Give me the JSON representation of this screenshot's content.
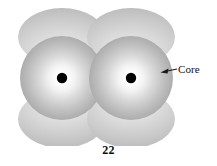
{
  "figure": {
    "caption_number": "22",
    "alt_title": "Overlapping atomic orbitals with cores",
    "background_color": "#ffffff"
  },
  "annotations": {
    "core_label": "Core",
    "core_label_color": "#111111",
    "arrow_color": "#1a1a1a"
  },
  "diagram": {
    "type": "orbital-overlap",
    "lobe_color_light": "#e4e4e4",
    "lobe_color_mid": "#cdcdcd",
    "lobe_color_dark": "#b9b9b9",
    "core_highlight_color": "#ffffff",
    "core_mid_color": "#d2d2d2",
    "core_edge_color": "#a8a8a8",
    "nucleus_color": "#000000",
    "nuclei": [
      {
        "name": "left-nucleus",
        "cx": 62,
        "cy": 78,
        "r": 5
      },
      {
        "name": "right-nucleus",
        "cx": 131,
        "cy": 78,
        "r": 5
      }
    ],
    "cores": [
      {
        "name": "left-core",
        "cx": 62,
        "cy": 78,
        "rx": 42,
        "ry": 42
      },
      {
        "name": "right-core",
        "cx": 131,
        "cy": 78,
        "rx": 42,
        "ry": 42
      }
    ],
    "lobes": [
      {
        "name": "top-left-lobe",
        "cx": 62,
        "cy": 37,
        "rx": 44,
        "ry": 29
      },
      {
        "name": "top-right-lobe",
        "cx": 131,
        "cy": 37,
        "rx": 44,
        "ry": 29
      },
      {
        "name": "bottom-left-lobe",
        "cx": 62,
        "cy": 119,
        "rx": 44,
        "ry": 29
      },
      {
        "name": "bottom-right-lobe",
        "cx": 131,
        "cy": 119,
        "rx": 44,
        "ry": 29
      }
    ],
    "axis_line": {
      "name": "internuclear-axis",
      "x1": 20,
      "y1": 78,
      "x2": 175,
      "y2": 78
    }
  }
}
